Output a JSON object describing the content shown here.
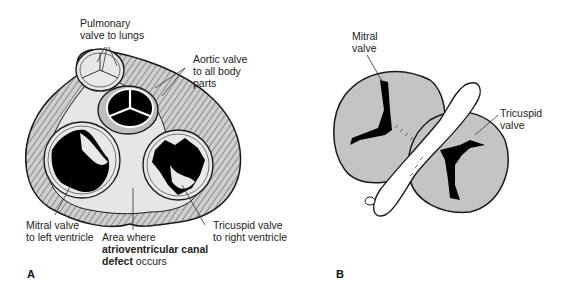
{
  "figure": {
    "panel_a": {
      "letter": "A",
      "labels": {
        "pulmonary": [
          "Pulmonary",
          "valve to lungs"
        ],
        "aortic": [
          "Aortic valve",
          "to all body",
          "parts"
        ],
        "mitral": [
          "Mitral valve",
          "to left ventricle"
        ],
        "area": {
          "line1": "Area where",
          "bold": "atrioventricular canal",
          "bold2": "defect",
          "rest": " occurs"
        },
        "tricuspid": [
          "Tricuspid valve",
          "to right ventricle"
        ]
      }
    },
    "panel_b": {
      "letter": "B",
      "labels": {
        "mitral": [
          "Mitral",
          "valve"
        ],
        "tricuspid": [
          "Tricuspid",
          "valve"
        ]
      }
    },
    "colors": {
      "tissue": "#c9c9c9",
      "light": "#e6e6e6",
      "dark": "#000000",
      "outline": "#1a1a1a"
    }
  }
}
